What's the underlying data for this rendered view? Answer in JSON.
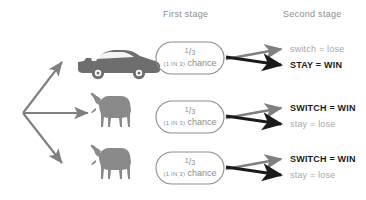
{
  "diagram": {
    "title_visible": false,
    "headers": {
      "first_stage": "First stage",
      "second_stage": "Second stage"
    },
    "colors": {
      "gray_arrow": "#808080",
      "black_arrow": "#1a1a1a",
      "text_gray": "#8c8c8c",
      "text_dim": "#a8a8a8",
      "text_strong": "#1a1a1a",
      "oval_stroke": "#8c8c8c",
      "background": "#ffffff"
    },
    "branches": [
      {
        "prize_icon": "car-icon",
        "prize_label": "car",
        "probability_numerator": "1",
        "probability_slash": "/",
        "probability_denominator": "3",
        "chance_paren": "(1 IN 3)",
        "chance_word": "chance",
        "outcomes": [
          {
            "text": "switch = lose",
            "emphasis": "dim",
            "arrow": "gray"
          },
          {
            "text": "STAY = WIN",
            "emphasis": "strong",
            "arrow": "black"
          }
        ]
      },
      {
        "prize_icon": "goat-icon",
        "prize_label": "goat",
        "probability_numerator": "1",
        "probability_slash": "/",
        "probability_denominator": "3",
        "chance_paren": "(1 IN 3)",
        "chance_word": "chance",
        "outcomes": [
          {
            "text": "SWITCH = WIN",
            "emphasis": "strong",
            "arrow": "gray"
          },
          {
            "text": "stay = lose",
            "emphasis": "dim",
            "arrow": "black"
          }
        ]
      },
      {
        "prize_icon": "goat-icon",
        "prize_label": "goat",
        "probability_numerator": "1",
        "probability_slash": "/",
        "probability_denominator": "3",
        "chance_paren": "(1 IN 3)",
        "chance_word": "chance",
        "outcomes": [
          {
            "text": "SWITCH = WIN",
            "emphasis": "strong",
            "arrow": "gray"
          },
          {
            "text": "stay = lose",
            "emphasis": "dim",
            "arrow": "black"
          }
        ]
      }
    ]
  }
}
